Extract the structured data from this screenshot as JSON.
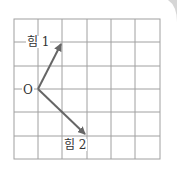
{
  "diagram": {
    "grid": {
      "cols": 6,
      "rows": 6
    },
    "origin_label": "O",
    "vectors": [
      {
        "label": "힘 1",
        "from": [
          0,
          0
        ],
        "to": [
          1,
          2
        ]
      },
      {
        "label": "힘 2",
        "from": [
          0,
          0
        ],
        "to": [
          2,
          -2
        ]
      }
    ],
    "colors": {
      "grid": "#9a9a9a",
      "arrow": "#666666",
      "corner": "#cfcfcf"
    }
  }
}
